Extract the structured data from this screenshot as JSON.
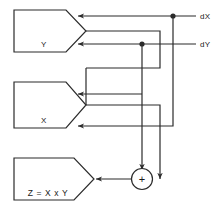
{
  "diagram": {
    "stroke_color": "#2b2b2b",
    "background_color": "#ffffff",
    "blocks": [
      {
        "id": "y",
        "label": "Y",
        "role": "register-y"
      },
      {
        "id": "x",
        "label": "X",
        "role": "register-x"
      },
      {
        "id": "z",
        "label": "Z = X x Y",
        "role": "register-z"
      }
    ],
    "operators": [
      {
        "id": "adder",
        "label": "+",
        "shape": "circle",
        "role": "adder"
      }
    ],
    "signals": [
      {
        "id": "dx",
        "label": "dX"
      },
      {
        "id": "dy",
        "label": "dY"
      }
    ],
    "connections": [
      {
        "from": "dX",
        "to": "Y",
        "port": "top"
      },
      {
        "from": "Y",
        "to": "X",
        "port": "vertex-out"
      },
      {
        "from": "dY",
        "to": "Y",
        "port": "bottom"
      },
      {
        "from": "dY",
        "to": "X",
        "port": "top"
      },
      {
        "from": "X",
        "to": "adder",
        "port": "vertex-out"
      },
      {
        "from": "dX",
        "to": "X",
        "port": "bottom"
      },
      {
        "from": "adder",
        "to": "Z",
        "port": "vertex-in"
      }
    ]
  }
}
